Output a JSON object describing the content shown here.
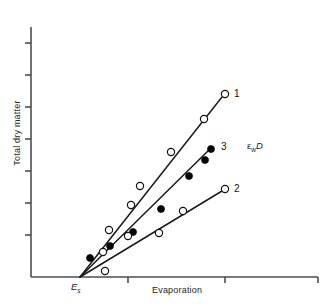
{
  "chart_data": {
    "type": "line",
    "title": "",
    "subtitle": "",
    "xlabel": "Evaporation",
    "ylabel": "Total dry matter",
    "grid": false,
    "legend_position": "inline-right-end-of-line",
    "axis_tick_labels": {
      "x": [
        "E_s"
      ],
      "y": []
    },
    "x_intercept_label": "Es",
    "annotations": [
      {
        "text": "εwD",
        "epsilon": "ε",
        "subscript": "w",
        "symbol": "D",
        "x": 247,
        "y": 140
      }
    ],
    "convergence_point": {
      "x": 80,
      "y": 277
    },
    "axis_pixel_geometry": {
      "y_axis_x": 31,
      "y_axis_top": 27,
      "x_axis_y": 277,
      "x_axis_right": 318,
      "y_ticks_y": [
        43,
        75,
        107,
        139,
        171,
        203,
        235
      ],
      "x_ticks_x": [
        128,
        225,
        318
      ]
    },
    "series": [
      {
        "name": "1",
        "label": "1",
        "marker": "open-circle",
        "slope_rank": "steepest",
        "line_end": {
          "x": 222,
          "y": 97
        },
        "points": [
          {
            "x": 103,
            "y": 252
          },
          {
            "x": 109,
            "y": 230
          },
          {
            "x": 131,
            "y": 205
          },
          {
            "x": 140,
            "y": 186
          },
          {
            "x": 171,
            "y": 152
          },
          {
            "x": 204,
            "y": 119
          },
          {
            "x": 225,
            "y": 94
          }
        ]
      },
      {
        "name": "3",
        "label": "3",
        "marker": "filled-circle",
        "slope_rank": "middle",
        "line_end": {
          "x": 211,
          "y": 148
        },
        "points": [
          {
            "x": 90,
            "y": 258
          },
          {
            "x": 110,
            "y": 246
          },
          {
            "x": 133,
            "y": 232
          },
          {
            "x": 161,
            "y": 209
          },
          {
            "x": 189,
            "y": 176
          },
          {
            "x": 205,
            "y": 160
          },
          {
            "x": 211,
            "y": 149
          }
        ]
      },
      {
        "name": "2",
        "label": "2",
        "marker": "open-circle",
        "slope_rank": "shallowest",
        "line_end": {
          "x": 222,
          "y": 191
        },
        "points": [
          {
            "x": 105,
            "y": 271
          },
          {
            "x": 128,
            "y": 236
          },
          {
            "x": 159,
            "y": 233
          },
          {
            "x": 183,
            "y": 211
          },
          {
            "x": 225,
            "y": 189
          }
        ]
      }
    ],
    "colors": {
      "line": "#1a1a1a",
      "axis": "#4d4d4d",
      "marker_fill_open": "#ffffff",
      "marker_fill_closed": "#000000",
      "text": "#1a1a1a",
      "background": "#ffffff"
    }
  }
}
